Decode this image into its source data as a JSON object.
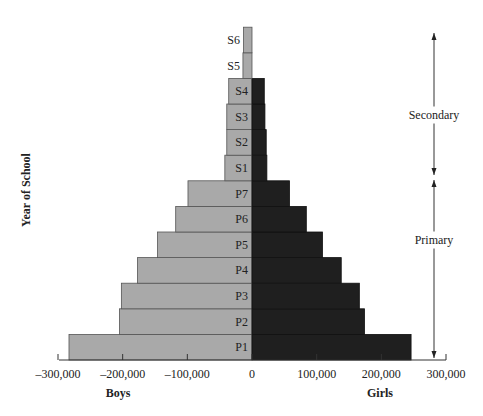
{
  "chart_data": {
    "type": "bar",
    "subtype": "population-pyramid (horizontal diverging bars)",
    "title": "",
    "ylabel": "Year of School",
    "xlabel_left": "Boys",
    "xlabel_right": "Girls",
    "categories": [
      "P1",
      "P2",
      "P3",
      "P4",
      "P5",
      "P6",
      "P7",
      "S1",
      "S2",
      "S3",
      "S4",
      "S5",
      "S6"
    ],
    "series": [
      {
        "name": "Boys",
        "color": "#a9a9a9",
        "values": [
          283000,
          205000,
          202000,
          177000,
          146000,
          118000,
          99000,
          42000,
          39000,
          39000,
          36000,
          14000,
          13000
        ]
      },
      {
        "name": "Girls",
        "color": "#1f1f1f",
        "values": [
          246000,
          174000,
          166000,
          138000,
          109000,
          84000,
          58000,
          23000,
          22000,
          20000,
          19000,
          0,
          0
        ]
      }
    ],
    "xticks": [
      {
        "value": -300000,
        "label": "–300,000"
      },
      {
        "value": -200000,
        "label": "–200,000"
      },
      {
        "value": -100000,
        "label": "–100,000"
      },
      {
        "value": 0,
        "label": "0"
      },
      {
        "value": 100000,
        "label": "100,000"
      },
      {
        "value": 200000,
        "label": "200,000"
      },
      {
        "value": 300000,
        "label": "300,000"
      }
    ],
    "xlim": [
      -300000,
      300000
    ],
    "grid": false,
    "legend": "none",
    "annotations": [
      {
        "label": "Secondary",
        "from": "S1",
        "to": "S6",
        "type": "double-arrow"
      },
      {
        "label": "Primary",
        "from": "P1",
        "to": "P7",
        "type": "double-arrow"
      }
    ]
  }
}
